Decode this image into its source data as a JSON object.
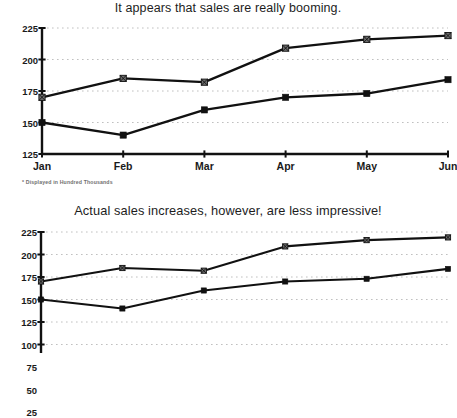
{
  "chart_data": [
    {
      "type": "line",
      "title": "It appears that sales are really booming.",
      "xlabel": "",
      "ylabel": "",
      "categories": [
        "Jan",
        "Feb",
        "Mar",
        "Apr",
        "May",
        "Jun"
      ],
      "yticks": [
        125,
        150,
        175,
        200,
        225
      ],
      "ylim": [
        125,
        225
      ],
      "grid": true,
      "legend": "none",
      "note": "* Displayed in Hundred Thousands",
      "series": [
        {
          "name": "Projected Sales",
          "marker": "x",
          "values": [
            170,
            185,
            182,
            209,
            216,
            219
          ]
        },
        {
          "name": "Actual Sales",
          "marker": "square",
          "values": [
            150,
            140,
            160,
            170,
            173,
            184
          ]
        }
      ]
    },
    {
      "type": "line",
      "title": "Actual sales increases, however, are less impressive!",
      "xlabel": "",
      "ylabel": "",
      "categories": [
        "Jan",
        "Feb",
        "Mar",
        "Apr",
        "May",
        "Jun"
      ],
      "yticks": [
        225,
        200,
        175,
        150,
        125,
        100,
        75,
        50,
        25
      ],
      "ylim": [
        0,
        225
      ],
      "grid": true,
      "legend": "none",
      "series": [
        {
          "name": "Projected Sales",
          "marker": "x",
          "values": [
            170,
            185,
            182,
            209,
            216,
            219
          ]
        },
        {
          "name": "Actual Sales",
          "marker": "square",
          "values": [
            150,
            140,
            160,
            170,
            173,
            184
          ]
        }
      ]
    }
  ],
  "colors": {
    "line": "#111111",
    "axis": "#111111",
    "grid": "#b9b9b9",
    "text": "#1a1a1a",
    "note": "#6f6f6f",
    "background": "#ffffff"
  },
  "chart1": {
    "title": "It appears that sales are really booming.",
    "yticks": [
      "225",
      "200",
      "175",
      "150",
      "125"
    ],
    "xticks": [
      "Jan",
      "Feb",
      "Mar",
      "Apr",
      "May",
      "Jun"
    ],
    "footnote": "* Displayed in Hundred Thousands"
  },
  "chart2": {
    "title": "Actual sales increases, however, are less impressive!",
    "yticks": [
      "225",
      "200",
      "175",
      "150",
      "125",
      "100",
      "75",
      "50",
      "25"
    ],
    "xticks": [
      "Jan",
      "Feb",
      "Mar",
      "Apr",
      "May",
      "Jun"
    ]
  }
}
